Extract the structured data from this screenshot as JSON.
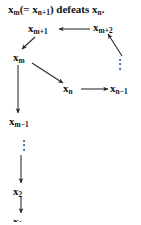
{
  "figure": {
    "caption": {
      "part1": "x",
      "sub1": "m",
      "part2": "(= x",
      "sub2": "n+1",
      "part3": ") defeats x",
      "sub3": "n",
      "part4": ".",
      "full_text": "x_m(= x_n+1) defeats x_n."
    },
    "nodes": {
      "xm1_plus": {
        "base": "x",
        "sub": "m+1"
      },
      "xm2_plus": {
        "base": "x",
        "sub": "m+2"
      },
      "xm": {
        "base": "x",
        "sub": "m"
      },
      "xn": {
        "base": "x",
        "sub": "n"
      },
      "xn_minus": {
        "base": "x",
        "sub": "n−1"
      },
      "xm_minus": {
        "base": "x",
        "sub": "m−1"
      },
      "x2": {
        "base": "x",
        "sub": "2"
      },
      "x1": {
        "base": "x",
        "sub": "1"
      }
    },
    "ellipses": {
      "right_vertical": "⋮",
      "left_vertical": "⋮"
    },
    "arrows": [
      {
        "name": "xm2-to-xm1",
        "direction": "left",
        "from": "x_m+2",
        "to": "x_m+1"
      },
      {
        "name": "xm1-to-xm",
        "direction": "down-left",
        "from": "x_m+1",
        "to": "x_m"
      },
      {
        "name": "xn1-to-xm2",
        "direction": "up-right",
        "from": "x_n-1 column",
        "to": "x_m+2"
      },
      {
        "name": "xm-to-xn",
        "direction": "down-right",
        "from": "x_m",
        "to": "x_n"
      },
      {
        "name": "xn-to-xn1",
        "direction": "right",
        "from": "x_n",
        "to": "x_n−1"
      },
      {
        "name": "xm-to-xm1",
        "direction": "down",
        "from": "x_m",
        "to": "x_m−1"
      },
      {
        "name": "dots-to-x2",
        "direction": "down",
        "from": "⋮",
        "to": "x_2"
      },
      {
        "name": "x2-to-x1",
        "direction": "down",
        "from": "x_2",
        "to": "x_1"
      }
    ],
    "colors": {
      "ink": "#262626",
      "background": "#ffffff"
    }
  }
}
